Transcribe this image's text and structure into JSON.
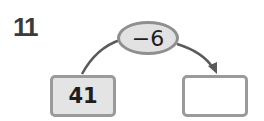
{
  "problem": {
    "number": "11",
    "operation": "−6",
    "start_value": "41",
    "answer_value": ""
  },
  "colors": {
    "start_box_fill": "#e4e4e4",
    "oval_fill": "#e2e2e2",
    "border": "#9a9a9a",
    "arrow": "#5a5a5a"
  }
}
